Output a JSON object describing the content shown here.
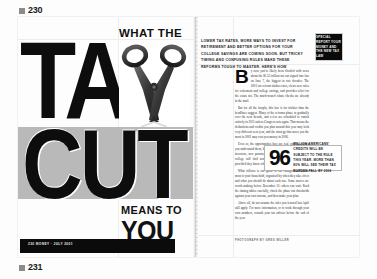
{
  "markers": {
    "top_page": "230",
    "bottom_page": "231"
  },
  "colors": {
    "ink": "#0d0d0d",
    "band_gray": "#b9b9b9",
    "paper": "#fdfdfd",
    "footer_black": "#0b0b0b"
  },
  "left_page": {
    "kicker": "WHAT THE",
    "headline_line1": "TAX",
    "headline_line2": "CUT",
    "subline_small": "MEANS TO",
    "subline_large": "YOU",
    "footer_text": "230  MONEY  ·  JULY 2001",
    "scissors_alt": "open steel scissors photograph"
  },
  "right_page": {
    "deck": "LOWER TAX RATES, MORE WAYS TO INVEST FOR RETIREMENT AND BETTER OPTIONS FOR YOUR COLLEGE SAVINGS ARE COMING SOON. BUT TRICKY TIMING AND CONFUSING RULES MAKE THESE REFORMS TOUGH TO MASTER. HERE'S HOW",
    "deck_bold_1": "TRICKY TIMING",
    "deck_bold_2": "AND CONFUSING RULES",
    "logo_text": "SPECIAL REPORT YOUR MONEY AND THE NEW TAX LAW",
    "dropcap": "B",
    "body": [
      "y now you've likely been flooded with news about the $1.35 trillion tax cut signed into law on June 7, the biggest in two decades. The 2001 tax reform slashes rates, clears new rules for retirement and college savings, and provides relief for the estate tax. The much-touted rebate checks are already in the mail.",
      "But for all the hoopla, this law is far trickier than the headlines suggest. Many of the reforms phase in gradually over the next decade, and a few are scheduled to vanish entirely in 2011 unless Congress acts again. That means the deductions and credits you plan around this year may look very different next year, and the strategy that saves you the most in 2002 may cost you money in 2006.",
      "Even so, the opportunities here are real, and the sooner you understand them, the more you stand to keep. Retirees, investors, new parents, and above all anyone saving for college will find something to like in the fine print, provided they know when to act and when to wait.",
      "What follows is our guide to the changes that matter most to your household, organized by when they take effect and what you should do about each one. Some moves are worth making before December 31; others can wait. Read the timing tables carefully, check the phase-out thresholds against your own income, and then make your plan.",
      "Above all, do not assume the rules you learned last April still apply. For more information, or to work through your own numbers, consult your tax adviser before the end of the year."
    ],
    "pullquote": {
      "number": "96",
      "text": "MILLION AMERICANS' CREDITS WILL BE SUBJECT TO THE RULE THIS YEAR. MORE THAN 80% WILL SEE THEIR TAX BURDEN FALL BY 2006"
    },
    "credit": "PHOTOGRAPH BY GREG MILLER"
  }
}
